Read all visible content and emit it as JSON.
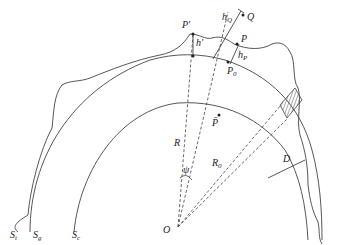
{
  "figure": {
    "type": "geodesy-cross-section",
    "colors": {
      "stroke": "#444444",
      "hatch": "#555555",
      "background": "#ffffff"
    }
  },
  "labels": {
    "P_prime": "P'",
    "h_prime": "h'",
    "Q": "Q",
    "h_Q": {
      "base": "h",
      "sub": "Q"
    },
    "P": "P",
    "h_P": {
      "base": "h",
      "sub": "P"
    },
    "P_0": {
      "base": "P",
      "sub": "0"
    },
    "P_bar": "P̄",
    "R": "R",
    "R_0": {
      "base": "R",
      "sub": "0"
    },
    "psi": "ψ",
    "D": "D",
    "O": "O",
    "S_t": {
      "base": "S",
      "sub": "t"
    },
    "S_g": {
      "base": "S",
      "sub": "g"
    },
    "S_c": {
      "base": "S",
      "sub": "c"
    }
  }
}
